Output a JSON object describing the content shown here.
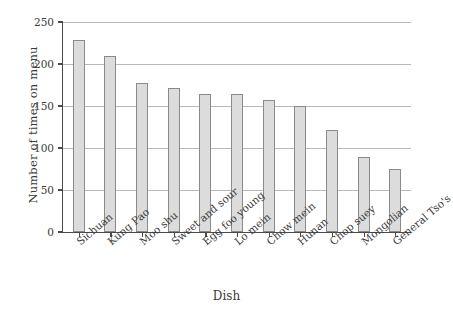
{
  "chart_data": {
    "type": "bar",
    "title": "",
    "xlabel": "Dish",
    "ylabel": "Number of times on menu",
    "categories": [
      "Sichuan",
      "Kung Pao",
      "Moo shu",
      "Sweet and sour",
      "Egg foo young",
      "Lo mein",
      "Chow mein",
      "Hunan",
      "Chop suey",
      "Mongolian",
      "General Tso's"
    ],
    "values": [
      228,
      209,
      177,
      172,
      164,
      164,
      157,
      150,
      122,
      89,
      75
    ],
    "ylim": [
      0,
      250
    ],
    "ytick_labels": [
      "0",
      "50",
      "100",
      "150",
      "200",
      "250"
    ],
    "ytick_values": [
      0,
      50,
      100,
      150,
      200,
      250
    ],
    "grid": true,
    "legend": null,
    "bar_color": "#dcdcdc",
    "bar_edge_color": "#8a8a8a",
    "axis_color": "#4a4a4a",
    "grid_color": "#b9b9b9"
  }
}
